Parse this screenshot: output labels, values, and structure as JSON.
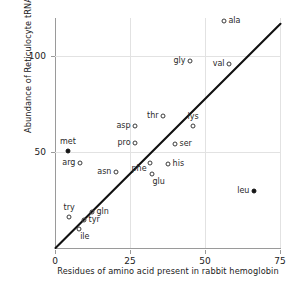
{
  "chart_data": {
    "type": "scatter",
    "title": "",
    "xlabel": "Residues of amino acid present in rabbit hemoglobin",
    "ylabel": "Abundance of Reticulocyte tRNA",
    "xlim": [
      0,
      75
    ],
    "ylim": [
      0,
      120
    ],
    "xticks": [
      0,
      25,
      50,
      75
    ],
    "yticks": [
      50,
      100
    ],
    "xtick_labels": [
      "0",
      "25",
      "50",
      "75"
    ],
    "ytick_labels": [
      "50",
      "100"
    ],
    "grid": true,
    "legend": "none",
    "trendline": {
      "x0": 0,
      "y0": 0,
      "x1": 75,
      "y1": 117
    },
    "points": [
      {
        "label": "ala",
        "x": 56.3,
        "y": 118.5,
        "fill": "open",
        "label_pos": "right"
      },
      {
        "label": "gly",
        "x": 45.0,
        "y": 97.5,
        "fill": "open",
        "label_pos": "left"
      },
      {
        "label": "val",
        "x": 58.0,
        "y": 96.0,
        "fill": "open",
        "label_pos": "left"
      },
      {
        "label": "thr",
        "x": 36.0,
        "y": 69.0,
        "fill": "open",
        "label_pos": "left"
      },
      {
        "label": "lys",
        "x": 46.0,
        "y": 63.8,
        "fill": "open",
        "label_pos": "above"
      },
      {
        "label": "asp",
        "x": 26.7,
        "y": 63.5,
        "fill": "open",
        "label_pos": "left"
      },
      {
        "label": "pro",
        "x": 26.7,
        "y": 54.7,
        "fill": "open",
        "label_pos": "left"
      },
      {
        "label": "ser",
        "x": 40.0,
        "y": 54.2,
        "fill": "open",
        "label_pos": "right"
      },
      {
        "label": "met",
        "x": 4.3,
        "y": 50.5,
        "fill": "filled",
        "label_pos": "above"
      },
      {
        "label": "arg",
        "x": 8.3,
        "y": 44.2,
        "fill": "open",
        "label_pos": "left"
      },
      {
        "label": "his",
        "x": 37.7,
        "y": 43.8,
        "fill": "open",
        "label_pos": "right"
      },
      {
        "label": "phe",
        "x": 31.7,
        "y": 44.5,
        "fill": "open",
        "label_pos": "below-left"
      },
      {
        "label": "asn",
        "x": 20.3,
        "y": 39.5,
        "fill": "open",
        "label_pos": "left"
      },
      {
        "label": "glu",
        "x": 32.3,
        "y": 38.5,
        "fill": "open",
        "label_pos": "below"
      },
      {
        "label": "leu",
        "x": 66.3,
        "y": 30.0,
        "fill": "filled",
        "label_pos": "left"
      },
      {
        "label": "gln",
        "x": 12.3,
        "y": 19.0,
        "fill": "open",
        "label_pos": "right"
      },
      {
        "label": "try",
        "x": 4.7,
        "y": 16.0,
        "fill": "open",
        "label_pos": "above"
      },
      {
        "label": "tyr",
        "x": 9.7,
        "y": 14.5,
        "fill": "open",
        "label_pos": "right"
      },
      {
        "label": "ile",
        "x": 8.0,
        "y": 10.0,
        "fill": "open",
        "label_pos": "below"
      }
    ]
  }
}
